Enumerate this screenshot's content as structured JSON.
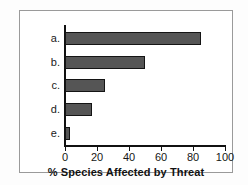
{
  "chart_data": {
    "type": "bar",
    "orientation": "horizontal",
    "title": "",
    "subtitle": "",
    "categories": [
      "a.",
      "b.",
      "c.",
      "d.",
      "e."
    ],
    "values": [
      85,
      50,
      25,
      17,
      3
    ],
    "series": [
      {
        "name": "% Species Affected by Threat",
        "values": [
          85,
          50,
          25,
          17,
          3
        ]
      }
    ],
    "xlabel": "% Species Affected by Threat",
    "ylabel": "",
    "xlim": [
      0,
      100
    ],
    "xticks": [
      0,
      20,
      40,
      60,
      80,
      100
    ],
    "xtick_labels": [
      "0",
      "20",
      "40",
      "60",
      "80",
      "100"
    ],
    "grid": false,
    "legend": false,
    "legend_position": "none",
    "annotations": [],
    "colors": {
      "bar_fill": "#555555",
      "bar_outline": "#141414",
      "axis": "#111111",
      "plot_background": "#ffffff",
      "frame_border": "#9a9a9a",
      "page_background": "#fdfdfd",
      "text": "#161616"
    }
  }
}
